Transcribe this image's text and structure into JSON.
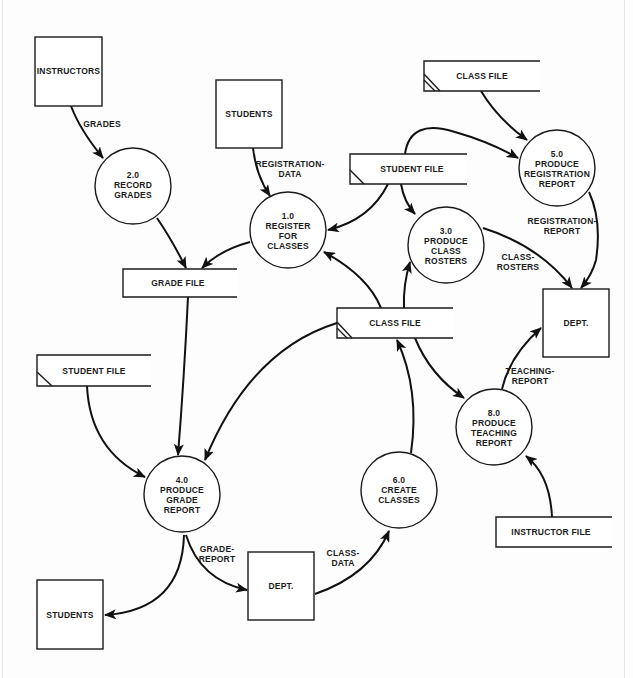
{
  "diagram": {
    "type": "data-flow-diagram",
    "external_entities": [
      {
        "id": "instructors",
        "label": "INSTRUCTORS"
      },
      {
        "id": "students_top",
        "label": "STUDENTS"
      },
      {
        "id": "dept_right",
        "label": "DEPT."
      },
      {
        "id": "dept_bottom",
        "label": "DEPT."
      },
      {
        "id": "students_bottom",
        "label": "STUDENTS"
      }
    ],
    "processes": [
      {
        "id": "p1",
        "number": "1.0",
        "lines": [
          "REGISTER",
          "FOR",
          "CLASSES"
        ]
      },
      {
        "id": "p2",
        "number": "2.0",
        "lines": [
          "RECORD",
          "GRADES"
        ]
      },
      {
        "id": "p3",
        "number": "3.0",
        "lines": [
          "PRODUCE",
          "CLASS",
          "ROSTERS"
        ]
      },
      {
        "id": "p4",
        "number": "4.0",
        "lines": [
          "PRODUCE",
          "GRADE",
          "REPORT"
        ]
      },
      {
        "id": "p5",
        "number": "5.0",
        "lines": [
          "PRODUCE",
          "REGISTRATION",
          "REPORT"
        ]
      },
      {
        "id": "p6",
        "number": "6.0",
        "lines": [
          "CREATE",
          "CLASSES"
        ]
      },
      {
        "id": "p8",
        "number": "8.0",
        "lines": [
          "PRODUCE",
          "TEACHING",
          "REPORT"
        ]
      }
    ],
    "data_stores": [
      {
        "id": "class_file_top",
        "label": "CLASS FILE"
      },
      {
        "id": "student_file_mid",
        "label": "STUDENT FILE"
      },
      {
        "id": "grade_file",
        "label": "GRADE FILE"
      },
      {
        "id": "class_file_mid",
        "label": "CLASS FILE"
      },
      {
        "id": "student_file_left",
        "label": "STUDENT FILE"
      },
      {
        "id": "instructor_file",
        "label": "INSTRUCTOR FILE"
      }
    ],
    "flow_labels": {
      "grades": "GRADES",
      "registration_data": [
        "REGISTRATION-",
        "DATA"
      ],
      "registration_report": [
        "REGISTRATION-",
        "REPORT"
      ],
      "class_rosters": [
        "CLASS-",
        "ROSTERS"
      ],
      "teaching_report": [
        "TEACHING-",
        "REPORT"
      ],
      "grade_report": [
        "GRADE-",
        "REPORT"
      ],
      "class_data": [
        "CLASS-",
        "DATA"
      ]
    },
    "flows": [
      {
        "from": "instructors",
        "to": "p2",
        "label": "GRADES"
      },
      {
        "from": "students_top",
        "to": "p1",
        "label": "REGISTRATION-DATA"
      },
      {
        "from": "p2",
        "to": "grade_file",
        "label": ""
      },
      {
        "from": "p1",
        "to": "grade_file",
        "label": ""
      },
      {
        "from": "student_file_mid",
        "to": "p1",
        "label": ""
      },
      {
        "from": "student_file_mid",
        "to": "p3",
        "label": ""
      },
      {
        "from": "student_file_mid",
        "to": "p5",
        "label": ""
      },
      {
        "from": "class_file_top",
        "to": "p5",
        "label": ""
      },
      {
        "from": "p5",
        "to": "dept_right",
        "label": "REGISTRATION-REPORT"
      },
      {
        "from": "p3",
        "to": "dept_right",
        "label": "CLASS-ROSTERS"
      },
      {
        "from": "class_file_mid",
        "to": "p1",
        "label": ""
      },
      {
        "from": "class_file_mid",
        "to": "p3",
        "label": ""
      },
      {
        "from": "class_file_mid",
        "to": "p4",
        "label": ""
      },
      {
        "from": "class_file_mid",
        "to": "p8",
        "label": ""
      },
      {
        "from": "grade_file",
        "to": "p4",
        "label": ""
      },
      {
        "from": "student_file_left",
        "to": "p4",
        "label": ""
      },
      {
        "from": "p4",
        "to": "students_bottom",
        "label": ""
      },
      {
        "from": "p4",
        "to": "dept_bottom",
        "label": "GRADE-REPORT"
      },
      {
        "from": "dept_bottom",
        "to": "p6",
        "label": "CLASS-DATA"
      },
      {
        "from": "p6",
        "to": "class_file_mid",
        "label": ""
      },
      {
        "from": "p8",
        "to": "dept_right",
        "label": "TEACHING-REPORT"
      },
      {
        "from": "instructor_file",
        "to": "p8",
        "label": ""
      }
    ]
  }
}
